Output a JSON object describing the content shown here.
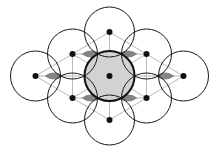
{
  "figure": {
    "type": "lattice-diagram",
    "canvas": {
      "width": 218,
      "height": 155,
      "background": "#ffffff"
    },
    "geometry": {
      "circle_radius": 25,
      "lattice_a": 37,
      "lattice_dx": 37,
      "lattice_dy": 22,
      "origin_x": 109.5,
      "origin_y": 76
    },
    "colors": {
      "background": "#ffffff",
      "circle_stroke": "#1a1a1a",
      "circle_fill": "none",
      "center_circle_fill": "#d2d2d2",
      "center_circle_stroke": "#111111",
      "lattice_line": "#b9b9b9",
      "lattice_dot": "#111111",
      "interstitial_void": "#7d7d7d"
    },
    "strokes": {
      "circle_width": 1,
      "center_circle_width": 2,
      "lattice_line_width": 1,
      "dot_radius": 3
    },
    "circles": [
      {
        "id": "circle-center",
        "label": "center",
        "cx": 109.5,
        "cy": 76,
        "r": 25,
        "shaded": true,
        "highlight": true
      },
      {
        "id": "circle-top",
        "label": "top",
        "cx": 109.5,
        "cy": 32,
        "r": 25,
        "shaded": false,
        "highlight": false
      },
      {
        "id": "circle-bottom",
        "label": "bottom",
        "cx": 109.5,
        "cy": 120,
        "r": 25,
        "shaded": false,
        "highlight": false
      },
      {
        "id": "circle-upper-left",
        "label": "upper-left",
        "cx": 72.5,
        "cy": 54,
        "r": 25,
        "shaded": false,
        "highlight": false
      },
      {
        "id": "circle-upper-right",
        "label": "upper-right",
        "cx": 146.5,
        "cy": 54,
        "r": 25,
        "shaded": false,
        "highlight": false
      },
      {
        "id": "circle-lower-left",
        "label": "lower-left",
        "cx": 72.5,
        "cy": 98,
        "r": 25,
        "shaded": false,
        "highlight": false
      },
      {
        "id": "circle-lower-right",
        "label": "lower-right",
        "cx": 146.5,
        "cy": 98,
        "r": 25,
        "shaded": false,
        "highlight": false
      },
      {
        "id": "circle-left",
        "label": "left",
        "cx": 35.5,
        "cy": 76,
        "r": 25,
        "shaded": false,
        "highlight": false
      },
      {
        "id": "circle-right",
        "label": "right",
        "cx": 183.5,
        "cy": 76,
        "r": 25,
        "shaded": false,
        "highlight": false
      }
    ],
    "lattice_dots": [
      {
        "id": "dot-center",
        "cx": 109.5,
        "cy": 76
      },
      {
        "id": "dot-top",
        "cx": 109.5,
        "cy": 32
      },
      {
        "id": "dot-bottom",
        "cx": 109.5,
        "cy": 120
      },
      {
        "id": "dot-upper-left",
        "cx": 72.5,
        "cy": 54
      },
      {
        "id": "dot-upper-right",
        "cx": 146.5,
        "cy": 54
      },
      {
        "id": "dot-lower-left",
        "cx": 72.5,
        "cy": 98
      },
      {
        "id": "dot-lower-right",
        "cx": 146.5,
        "cy": 98
      },
      {
        "id": "dot-left",
        "cx": 35.5,
        "cy": 76
      },
      {
        "id": "dot-right",
        "cx": 183.5,
        "cy": 76
      }
    ],
    "lattice_lines": [
      {
        "id": "line-horizontal-mid",
        "x1": 35.5,
        "y1": 76,
        "x2": 183.5,
        "y2": 76
      },
      {
        "id": "line-horizontal-upper",
        "x1": 72.5,
        "y1": 54,
        "x2": 146.5,
        "y2": 54
      },
      {
        "id": "line-horizontal-lower",
        "x1": 72.5,
        "y1": 98,
        "x2": 146.5,
        "y2": 98
      },
      {
        "id": "line-diag-a",
        "x1": 35.5,
        "y1": 76,
        "x2": 109.5,
        "y2": 32
      },
      {
        "id": "line-diag-b",
        "x1": 109.5,
        "y1": 32,
        "x2": 183.5,
        "y2": 76
      },
      {
        "id": "line-diag-c",
        "x1": 35.5,
        "y1": 76,
        "x2": 109.5,
        "y2": 120
      },
      {
        "id": "line-diag-d",
        "x1": 109.5,
        "y1": 120,
        "x2": 183.5,
        "y2": 76
      },
      {
        "id": "line-vert-center",
        "x1": 109.5,
        "y1": 32,
        "x2": 109.5,
        "y2": 120
      },
      {
        "id": "line-vert-left",
        "x1": 72.5,
        "y1": 54,
        "x2": 72.5,
        "y2": 98
      },
      {
        "id": "line-vert-right",
        "x1": 146.5,
        "y1": 54,
        "x2": 146.5,
        "y2": 98
      },
      {
        "id": "line-spoke-ul",
        "x1": 109.5,
        "y1": 76,
        "x2": 72.5,
        "y2": 54
      },
      {
        "id": "line-spoke-ur",
        "x1": 109.5,
        "y1": 76,
        "x2": 146.5,
        "y2": 54
      },
      {
        "id": "line-spoke-ll",
        "x1": 109.5,
        "y1": 76,
        "x2": 72.5,
        "y2": 98
      },
      {
        "id": "line-spoke-lr",
        "x1": 109.5,
        "y1": 76,
        "x2": 146.5,
        "y2": 98
      }
    ],
    "interstitial_voids": [
      {
        "id": "void-left",
        "cx": 54.0,
        "cy": 76,
        "size": 9.5
      },
      {
        "id": "void-inner-ul",
        "cx": 91.0,
        "cy": 54,
        "size": 9.5
      },
      {
        "id": "void-inner-ur",
        "cx": 128.0,
        "cy": 54,
        "size": 9.5
      },
      {
        "id": "void-inner-ll",
        "cx": 91.0,
        "cy": 98,
        "size": 9.5
      },
      {
        "id": "void-inner-lr",
        "cx": 128.0,
        "cy": 98,
        "size": 9.5
      },
      {
        "id": "void-right",
        "cx": 165.0,
        "cy": 76,
        "size": 9.5
      }
    ]
  }
}
